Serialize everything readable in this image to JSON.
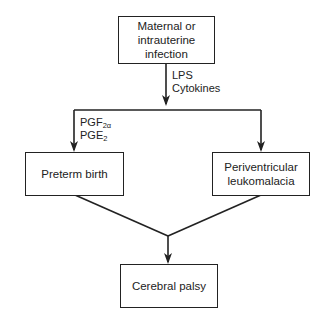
{
  "diagram": {
    "type": "flowchart",
    "nodes": {
      "infection": {
        "lines": [
          "Maternal or",
          "intrauterine",
          "infection"
        ]
      },
      "preterm_birth": {
        "lines": [
          "Preterm birth"
        ]
      },
      "pvl": {
        "lines": [
          "Periventricular",
          "leukomalacia"
        ]
      },
      "cerebral_palsy": {
        "lines": [
          "Cerebral palsy"
        ]
      }
    },
    "edge_labels": {
      "mediators": {
        "lines": [
          "LPS",
          "Cytokines"
        ]
      },
      "prostaglandins": {
        "pgf_base": "PGF",
        "pgf_sub": "2α",
        "pge_base": "PGE",
        "pge_sub": "2"
      }
    },
    "edges": [
      {
        "from": "Maternal or intrauterine infection",
        "to": "Preterm birth",
        "label": "LPS, Cytokines; PGF2α, PGE2"
      },
      {
        "from": "Maternal or intrauterine infection",
        "to": "Periventricular leukomalacia",
        "label": "LPS, Cytokines"
      },
      {
        "from": "Preterm birth",
        "to": "Cerebral palsy"
      },
      {
        "from": "Periventricular leukomalacia",
        "to": "Cerebral palsy"
      }
    ],
    "colors": {
      "line": "#222222",
      "background": "#ffffff"
    }
  }
}
